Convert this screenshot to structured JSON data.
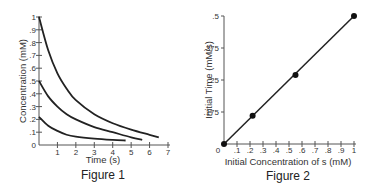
{
  "chart_data": [
    {
      "type": "line",
      "title": "Figure 1",
      "xlabel": "Time (s)",
      "ylabel": "Concentration (mM)",
      "xlim": [
        0,
        7
      ],
      "ylim": [
        0,
        1
      ],
      "x_ticks": [
        "1",
        "2",
        "3",
        "4",
        "5",
        "6",
        "7"
      ],
      "y_ticks": [
        "0",
        ".1",
        ".2",
        ".3",
        ".4",
        ".5",
        ".6",
        ".7",
        ".8",
        ".9",
        "1"
      ],
      "grid": false,
      "series": [
        {
          "name": "1 mM start",
          "x": [
            0,
            0.5,
            1,
            1.5,
            2,
            3,
            4,
            5,
            6,
            6.5
          ],
          "y": [
            1.0,
            0.74,
            0.56,
            0.44,
            0.35,
            0.24,
            0.17,
            0.12,
            0.08,
            0.06
          ]
        },
        {
          "name": "0.5 mM start",
          "x": [
            0,
            0.5,
            1,
            1.5,
            2,
            3,
            4,
            5,
            5.6
          ],
          "y": [
            0.5,
            0.38,
            0.3,
            0.24,
            0.2,
            0.14,
            0.1,
            0.06,
            0.04
          ]
        },
        {
          "name": "0.2 mM start",
          "x": [
            0,
            0.5,
            1,
            1.5,
            2,
            3,
            4,
            4.7
          ],
          "y": [
            0.22,
            0.15,
            0.11,
            0.08,
            0.065,
            0.05,
            0.04,
            0.035
          ]
        }
      ]
    },
    {
      "type": "scatter",
      "title": "Figure 2",
      "xlabel": "Initial Concentration of s (mM)",
      "ylabel": "Initial Time (mM/s)",
      "xlim": [
        0,
        1
      ],
      "ylim": [
        0,
        0.5
      ],
      "x_ticks": [
        "0",
        ".1",
        ".2",
        ".3",
        ".4",
        ".5",
        ".6",
        ".7",
        ".8",
        ".9",
        "1"
      ],
      "y_ticks": [
        ".175",
        ".25",
        ".375",
        ".5"
      ],
      "grid": false,
      "points": [
        {
          "x": 0.0,
          "y": 0.0
        },
        {
          "x": 0.22,
          "y": 0.11
        },
        {
          "x": 0.55,
          "y": 0.27
        },
        {
          "x": 1.0,
          "y": 0.5
        }
      ],
      "fit_line": true
    }
  ],
  "figures": {
    "fig1": {
      "caption": "Figure 1",
      "xlabel": "Time (s)",
      "ylabel": "Concentration (mM)"
    },
    "fig2": {
      "caption": "Figure 2",
      "xlabel": "Initial Concentration of s (mM)",
      "ylabel": "Initial Time (mM/s)"
    }
  }
}
